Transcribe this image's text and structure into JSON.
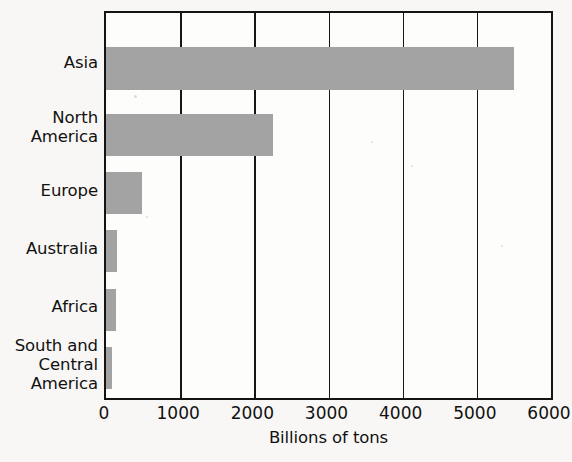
{
  "chart_data": {
    "type": "bar",
    "orientation": "horizontal",
    "title": "",
    "xlabel": "Billions of tons",
    "ylabel": "",
    "xlim": [
      0,
      6000
    ],
    "xticks": [
      0,
      1000,
      2000,
      3000,
      4000,
      5000,
      6000
    ],
    "xtick_labels": [
      "0",
      "1000",
      "2000",
      "3000",
      "4000",
      "5000",
      "6000"
    ],
    "grid": "vertical",
    "legend": "none",
    "bar_color": "#a3a3a3",
    "axis_color": "#141414",
    "background_color": "#f8f7f5",
    "categories": [
      "Asia",
      "North\nAmerica",
      "Europe",
      "Australia",
      "Africa",
      "South and\nCentral\nAmerica"
    ],
    "values": [
      5500,
      2250,
      480,
      150,
      130,
      75
    ],
    "series": [
      {
        "name": "Coal reserves",
        "values": [
          5500,
          2250,
          480,
          150,
          130,
          75
        ]
      }
    ]
  },
  "axis": {
    "x_title": "Billions of tons"
  }
}
